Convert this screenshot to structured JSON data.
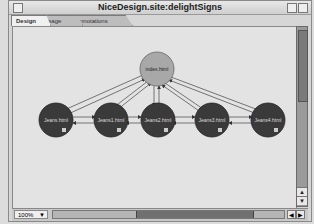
{
  "window": {
    "title": "NiceDesign.site:delightSigns"
  },
  "tabs": [
    {
      "label": "Design",
      "active": true
    },
    {
      "label": "Usage",
      "active": false
    },
    {
      "label": "Annotations",
      "active": false
    }
  ],
  "diagram": {
    "root": {
      "label": "index.html",
      "color": "#a8a8a8"
    },
    "pages": [
      {
        "label": "Jeans.html"
      },
      {
        "label": "Jeans1.html"
      },
      {
        "label": "Jeans2.html"
      },
      {
        "label": "Jeans3.html"
      },
      {
        "label": "Jeans4.html"
      }
    ],
    "page_color": "#3a3a3a",
    "link_color": "#555555"
  },
  "statusbar": {
    "zoom_level": "100%"
  },
  "icons": {
    "up_arrow": "▲",
    "down_arrow": "▼",
    "left_arrow": "◀",
    "right_arrow": "▶",
    "dropdown": "▼"
  }
}
